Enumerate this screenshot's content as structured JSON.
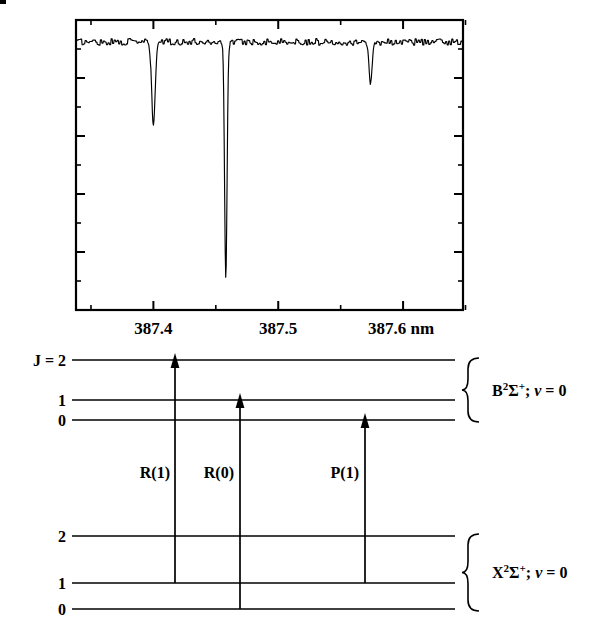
{
  "figure": {
    "kind": "spectrum-and-energy-level-diagram"
  },
  "spectrum": {
    "axis": {
      "x_left_nm": 387.338,
      "x_right_nm": 387.648,
      "major_ticks": [
        "387.4",
        "387.5",
        "387.6 nm"
      ],
      "major_tick_values": [
        387.4,
        387.5,
        387.6
      ],
      "minor_tick_values": [
        387.35,
        387.45,
        387.55,
        387.65
      ],
      "unit": "nm",
      "ylabel": "",
      "xlabel": ""
    },
    "tick_labels": [
      {
        "text": "387.4",
        "value": 387.4
      },
      {
        "text": "387.5",
        "value": 387.5
      },
      {
        "text": "387.6 nm",
        "value": 387.6
      }
    ]
  },
  "chart_data": {
    "type": "line",
    "title": "",
    "subtitle": "",
    "xlabel": "",
    "ylabel": "",
    "xlim": [
      387.338,
      387.648
    ],
    "ylim": [
      0,
      1
    ],
    "grid": false,
    "legend": null,
    "x_tick_labels": [
      "387.4",
      "387.5",
      "387.6 nm"
    ],
    "x_tick_values": [
      387.4,
      387.5,
      387.6
    ],
    "x_minor_tick_values": [
      387.35,
      387.45,
      387.55,
      387.65
    ],
    "baseline": 0.95,
    "noise_amplitude": 0.012,
    "lines": [
      {
        "label": "R(1)",
        "center_nm": 387.4,
        "depth": 0.3,
        "width_nm": 0.004,
        "min_value": 0.65
      },
      {
        "label": "R(0)",
        "center_nm": 387.458,
        "depth": 0.855,
        "width_nm": 0.0028,
        "min_value": 0.095
      },
      {
        "label": "P(1)",
        "center_nm": 387.574,
        "depth": 0.155,
        "width_nm": 0.0035,
        "min_value": 0.795
      }
    ]
  },
  "energy_diagram": {
    "upper_state": {
      "label_plain": "B2S+; v = 0",
      "term_symbol_base": "B",
      "term_symbol_superscript": "2",
      "term_symbol_sigma": "Σ",
      "term_symbol_charge": "+",
      "separator": "; ",
      "vibrational": "v",
      "equals": " = ",
      "vibrational_value": "0",
      "levels": [
        {
          "label": "J = 2",
          "J": 2
        },
        {
          "label": "1",
          "J": 1
        },
        {
          "label": "0",
          "J": 0
        }
      ]
    },
    "lower_state": {
      "label_plain": "X2S+; v = 0",
      "term_symbol_base": "X",
      "term_symbol_superscript": "2",
      "term_symbol_sigma": "Σ",
      "term_symbol_charge": "+",
      "separator": "; ",
      "vibrational": "v",
      "equals": " = ",
      "vibrational_value": "0",
      "levels": [
        {
          "label": "2",
          "J": 2
        },
        {
          "label": "1",
          "J": 1
        },
        {
          "label": "0",
          "J": 0
        }
      ]
    },
    "transitions": [
      {
        "label": "R(1)",
        "from_J": 1,
        "to_J": 2
      },
      {
        "label": "R(0)",
        "from_J": 0,
        "to_J": 1
      },
      {
        "label": "P(1)",
        "from_J": 1,
        "to_J": 0
      }
    ]
  },
  "colors": {
    "ink": "#000000",
    "background": "#ffffff"
  }
}
